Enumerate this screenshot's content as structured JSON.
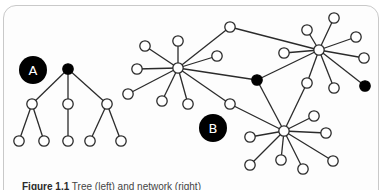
{
  "figure": {
    "labels": {
      "a": "A",
      "b": "B"
    },
    "caption_label": "Figure 1.1",
    "caption_text": "Tree (left) and network (right)",
    "colors": {
      "edge": "#2b2b2b",
      "node_fill": "#ffffff",
      "node_stroke": "#2b2b2b",
      "highlight": "#000000",
      "frame": "#c9c9c9",
      "badge": "#000000",
      "badge_text": "#ffffff"
    }
  },
  "tree_a": {
    "badge": {
      "x": 33,
      "y": 70,
      "r": 14,
      "label": "A"
    },
    "nodes": [
      {
        "id": "root",
        "x": 68,
        "y": 69,
        "filled": true
      },
      {
        "id": "l1",
        "x": 32,
        "y": 104
      },
      {
        "id": "l2",
        "x": 68,
        "y": 104
      },
      {
        "id": "l3",
        "x": 107,
        "y": 104
      },
      {
        "id": "l1a",
        "x": 19,
        "y": 141
      },
      {
        "id": "l1b",
        "x": 44,
        "y": 141
      },
      {
        "id": "l2a",
        "x": 68,
        "y": 141
      },
      {
        "id": "l3a",
        "x": 90,
        "y": 141
      },
      {
        "id": "l3b",
        "x": 121,
        "y": 141
      }
    ],
    "edges": [
      [
        "root",
        "l1"
      ],
      [
        "root",
        "l2"
      ],
      [
        "root",
        "l3"
      ],
      [
        "l1",
        "l1a"
      ],
      [
        "l1",
        "l1b"
      ],
      [
        "l2",
        "l2a"
      ],
      [
        "l3",
        "l3a"
      ],
      [
        "l3",
        "l3b"
      ]
    ]
  },
  "network_b": {
    "badge": {
      "x": 213,
      "y": 128,
      "r": 14,
      "label": "B"
    },
    "nodes": [
      {
        "id": "h1",
        "x": 178,
        "y": 68
      },
      {
        "id": "h1a",
        "x": 145,
        "y": 46
      },
      {
        "id": "h1b",
        "x": 178,
        "y": 41
      },
      {
        "id": "h1c",
        "x": 137,
        "y": 69
      },
      {
        "id": "h1d",
        "x": 128,
        "y": 94
      },
      {
        "id": "h1e",
        "x": 162,
        "y": 101
      },
      {
        "id": "h1f",
        "x": 188,
        "y": 104
      },
      {
        "id": "h1g",
        "x": 217,
        "y": 56
      },
      {
        "id": "c1",
        "x": 230,
        "y": 27
      },
      {
        "id": "c2",
        "x": 230,
        "y": 104
      },
      {
        "id": "k1",
        "x": 257,
        "y": 80,
        "filled": true
      },
      {
        "id": "h2",
        "x": 319,
        "y": 50
      },
      {
        "id": "h2a",
        "x": 334,
        "y": 18
      },
      {
        "id": "h2b",
        "x": 307,
        "y": 30
      },
      {
        "id": "h2c",
        "x": 356,
        "y": 37
      },
      {
        "id": "h2d",
        "x": 364,
        "y": 58
      },
      {
        "id": "h2e",
        "x": 284,
        "y": 53
      },
      {
        "id": "h2f",
        "x": 334,
        "y": 88
      },
      {
        "id": "k2",
        "x": 365,
        "y": 86,
        "filled": true
      },
      {
        "id": "c3",
        "x": 307,
        "y": 83
      },
      {
        "id": "h3",
        "x": 284,
        "y": 131
      },
      {
        "id": "h3a",
        "x": 250,
        "y": 137
      },
      {
        "id": "h3b",
        "x": 314,
        "y": 116
      },
      {
        "id": "h3c",
        "x": 326,
        "y": 133
      },
      {
        "id": "h3d",
        "x": 250,
        "y": 165
      },
      {
        "id": "h3e",
        "x": 281,
        "y": 160
      },
      {
        "id": "h3f",
        "x": 303,
        "y": 169
      },
      {
        "id": "h3g",
        "x": 333,
        "y": 161
      }
    ],
    "edges": [
      [
        "h1",
        "h1a"
      ],
      [
        "h1",
        "h1b"
      ],
      [
        "h1",
        "h1c"
      ],
      [
        "h1",
        "h1d"
      ],
      [
        "h1",
        "h1e"
      ],
      [
        "h1",
        "h1f"
      ],
      [
        "h1",
        "h1g"
      ],
      [
        "h1",
        "c1"
      ],
      [
        "c1",
        "h2"
      ],
      [
        "h1",
        "k1"
      ],
      [
        "h1",
        "c2"
      ],
      [
        "c2",
        "h3"
      ],
      [
        "h2",
        "h2a"
      ],
      [
        "h2",
        "h2b"
      ],
      [
        "h2",
        "h2c"
      ],
      [
        "h2",
        "h2d"
      ],
      [
        "h2",
        "h2e"
      ],
      [
        "h2",
        "h2f"
      ],
      [
        "h2",
        "k2"
      ],
      [
        "h2",
        "c3"
      ],
      [
        "h2",
        "k1"
      ],
      [
        "k1",
        "h3"
      ],
      [
        "c3",
        "h3"
      ],
      [
        "h3",
        "h3a"
      ],
      [
        "h3",
        "h3b"
      ],
      [
        "h3",
        "h3c"
      ],
      [
        "h3",
        "h3d"
      ],
      [
        "h3",
        "h3e"
      ],
      [
        "h3",
        "h3f"
      ],
      [
        "h3",
        "h3g"
      ]
    ]
  }
}
